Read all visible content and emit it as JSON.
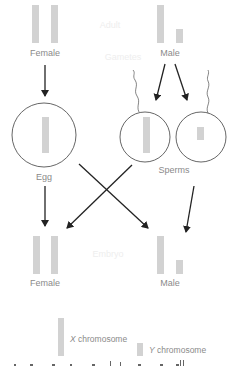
{
  "diagram": {
    "stages": {
      "adult": "Adult",
      "gametes": "Gametes",
      "embryo": "Embryo"
    },
    "adult": {
      "female_label": "Female",
      "male_label": "Male",
      "female_chromosomes": [
        "X",
        "X"
      ],
      "male_chromosomes": [
        "X",
        "Y"
      ]
    },
    "gametes": {
      "egg_label": "Egg",
      "egg_chromosomes": [
        "X"
      ],
      "sperms_label": "Sperms",
      "sperm_chromosomes": [
        [
          "X"
        ],
        [
          "Y"
        ]
      ]
    },
    "embryo": {
      "female_label": "Female",
      "male_label": "Male",
      "female_chromosomes": [
        "X",
        "X"
      ],
      "male_chromosomes": [
        "X",
        "Y"
      ]
    },
    "legend": {
      "x_label_letter": "X",
      "x_label_text": " chromosome",
      "y_label_letter": "Y",
      "y_label_text": " chromosome"
    },
    "colors": {
      "chromosome": "#d2d2d2",
      "arrow": "#222222",
      "cell_outline": "#555555",
      "label": "#8a8a8a"
    }
  }
}
